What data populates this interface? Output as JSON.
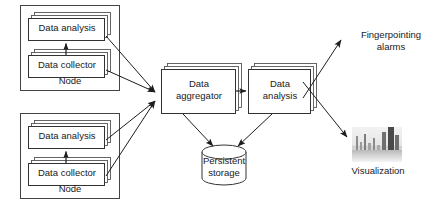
{
  "diagram": {
    "type": "block-flow-diagram",
    "background_color": "#ffffff",
    "stroke_color": "#333333",
    "text_color": "#1a1a1a"
  },
  "nodes": {
    "top": {
      "container_label": "Node",
      "components": [
        {
          "label": "Data analysis",
          "stacked": true
        },
        {
          "label": "Data collector",
          "stacked": true
        }
      ]
    },
    "bottom": {
      "container_label": "Node",
      "components": [
        {
          "label": "Data analysis",
          "stacked": true
        },
        {
          "label": "Data collector",
          "stacked": true
        }
      ]
    }
  },
  "pipeline": {
    "aggregator": {
      "line1": "Data",
      "line2": "aggregator",
      "stacked": true
    },
    "analysis": {
      "line1": "Data",
      "line2": "analysis",
      "stacked": true
    },
    "storage": {
      "line1": "Persistent",
      "line2": "storage",
      "shape": "cylinder"
    }
  },
  "outputs": {
    "alarms": {
      "line1": "Fingerpointing",
      "line2": "alarms"
    },
    "visualization": {
      "label": "Visualization",
      "thumbnail": "bar-chart-thumbnail"
    }
  },
  "icons": {
    "arrow": "arrow-icon",
    "cylinder": "database-cylinder-icon",
    "stack": "stacked-box-icon"
  }
}
